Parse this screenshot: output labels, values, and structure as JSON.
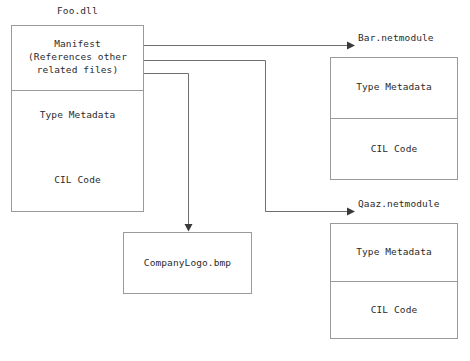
{
  "diagram": {
    "background_color": "#ffffff",
    "box_border_color": "#9a9a9a",
    "line_color": "#6f6f6f",
    "arrow_color": "#3a3a3a",
    "text_color": "#2b2b2b"
  },
  "assembly": {
    "caption": "Foo.dll",
    "sections": [
      {
        "label": "Manifest\n(References other\nrelated files)"
      },
      {
        "label": "Type Metadata"
      },
      {
        "label": "CIL Code"
      }
    ]
  },
  "modules": [
    {
      "caption": "Bar.netmodule",
      "sections": [
        {
          "label": "Type Metadata"
        },
        {
          "label": "CIL Code"
        }
      ]
    },
    {
      "caption": "Qaaz.netmodule",
      "sections": [
        {
          "label": "Type Metadata"
        },
        {
          "label": "CIL Code"
        }
      ]
    }
  ],
  "resource": {
    "caption": "CompanyLogo.bmp"
  }
}
